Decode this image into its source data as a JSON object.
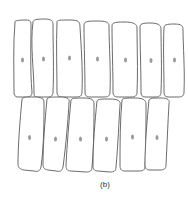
{
  "figure": {
    "caption": "(b)",
    "colors": {
      "outline": "#5a5a5a",
      "nucleus": "#9a9a9a",
      "background": "#ffffff"
    },
    "rows": [
      {
        "name": "top-row",
        "cell_count": 7,
        "cells": [
          {
            "d": "M15,22 C14,21 18,20 26,20 C31,20 31,22 31,26 C31,45 30,70 32,92 C32,96 30,97 26,97 L18,97 C15,97 14,95 14,92 C14,70 13,45 15,22 Z",
            "nucleus": [
              22.5,
              60
            ]
          },
          {
            "d": "M33,22 C33,20 36,19 44,19 C52,19 53,21 53,25 C53,45 54,70 53,92 C53,96 51,97 47,97 L37,97 C34,97 34,95 34,92 C34,70 30,45 33,22 Z",
            "nucleus": [
              43.5,
              59
            ]
          },
          {
            "d": "M57,22 C57,20 60,20 70,20 C79,20 80,22 80,27 C81,45 83,70 82,92 C82,96 80,97 76,97 L62,97 C58,97 57,95 57,92 C57,70 56,45 57,22 Z",
            "nucleus": [
              69.5,
              58
            ]
          },
          {
            "d": "M84,25 C84,22 86,21 96,21 C106,21 109,22 109,26 C109,45 111,70 110,92 C110,96 108,97 104,97 L90,97 C86,97 85,95 85,92 C85,70 84,45 84,25 Z",
            "nucleus": [
              97.5,
              59
            ]
          },
          {
            "d": "M112,26 C112,23 114,22 124,22 C134,22 137,24 137,28 C137,45 138,70 137,92 C137,96 135,97 131,97 L118,97 C114,97 113,95 113,92 C113,70 112,45 112,26 Z",
            "nucleus": [
              125.5,
              60
            ]
          },
          {
            "d": "M140,27 C140,24 142,23 150,23 C158,23 161,25 161,29 C161,45 162,70 161,92 C161,96 159,97 155,97 L145,97 C142,97 141,95 141,92 C141,70 140,45 140,27 Z",
            "nucleus": [
              151,
              60.5
            ]
          },
          {
            "d": "M164,28 C164,25 166,24 174,24 C182,24 183,26 183,30 C183,45 185,70 184,92 C184,96 182,97 178,97 L168,97 C165,97 164,95 164,92 C164,70 163,45 164,28 Z",
            "nucleus": [
              174.5,
              60
            ]
          }
        ]
      },
      {
        "name": "bottom-row",
        "cell_count": 6,
        "cells": [
          {
            "d": "M22,99 C23,97 26,97 34,97 C42,97 44,99 44,102 C44,120 44,145 41,167 C40,171 38,172 34,171 L24,170 C20,169 18,168 18,164 C18,145 20,120 22,99 Z",
            "nucleus": [
              29.5,
              137.5
            ]
          },
          {
            "d": "M47,99 C48,97 51,97 60,97 C68,97 70,99 69,103 C68,120 66,145 63,167 C62,171 60,172 56,171 L48,170 C44,169 43,168 43,164 C43,145 45,120 47,99 Z",
            "nucleus": [
              55.5,
              139
            ]
          },
          {
            "d": "M71,100 C72,98 75,98 84,98 C92,98 94,100 94,104 C94,120 94,145 92,167 C92,171 90,172 86,172 L71,171 C67,171 66,169 66,165 C67,145 69,120 71,100 Z",
            "nucleus": [
              80.5,
              139
            ]
          },
          {
            "d": "M97,101 C98,99 101,99 110,99 C118,99 121,101 120,105 C119,120 118,145 116,167 C116,171 114,172 110,172 L98,171 C94,171 93,169 93,165 C93,145 95,120 97,101 Z",
            "nucleus": [
              106.5,
              139
            ]
          },
          {
            "d": "M122,100 C123,98 126,98 135,98 C143,98 146,100 146,104 C146,120 146,145 145,166 C145,170 143,171 139,171 L125,171 C121,171 120,169 120,165 C120,145 120,120 122,100 Z",
            "nucleus": [
              132.5,
              137
            ]
          },
          {
            "d": "M149,100 C150,98 153,98 161,98 C168,98 170,100 169,104 C168,120 167,145 166,165 C166,169 164,170 160,170 L150,170 C146,170 145,168 145,164 C145,145 147,120 149,100 Z",
            "nucleus": [
              157,
              137.5
            ]
          }
        ]
      }
    ]
  }
}
